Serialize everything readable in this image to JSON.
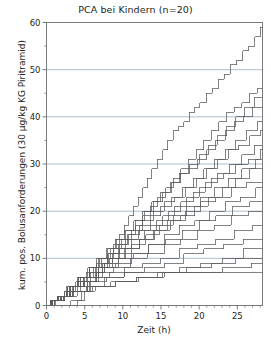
{
  "chart_data": {
    "type": "line",
    "title": "PCA bei Kindern (n=20)",
    "xlabel": "Zeit (h)",
    "ylabel": "kum. pos. Bolusanforderungen (30 µg/kg KG Piritramid)",
    "xlim": [
      0,
      28.3
    ],
    "ylim": [
      0,
      60
    ],
    "xticks": [
      0,
      5,
      10,
      15,
      20,
      25
    ],
    "xtick_labels": [
      "0",
      "5",
      "10",
      "15",
      "20",
      "25"
    ],
    "xminor_ticks": [
      1,
      2,
      3,
      4,
      6,
      7,
      8,
      9,
      11,
      12,
      13,
      14,
      16,
      17,
      18,
      19,
      21,
      22,
      23,
      24,
      26,
      27,
      28
    ],
    "yticks": [
      0,
      10,
      20,
      30,
      40,
      50,
      60
    ],
    "ytick_labels": [
      "0",
      "10",
      "20",
      "30",
      "40",
      "50",
      "60"
    ],
    "yminor_ticks": [
      5,
      15,
      25,
      35,
      45,
      55
    ],
    "grid": "horizontal-major",
    "gridlines_y": [
      10,
      20,
      30,
      40,
      50
    ],
    "grid_color": "#9fb8cc",
    "line_color": "#58595b",
    "axis_color": "#6d6e71",
    "legend": "none",
    "n_patients": 20,
    "interpolation": "step-after",
    "series": [
      {
        "name": "Patient 1",
        "x": [
          0,
          4.0,
          5.0,
          5.8,
          6.8,
          7.4,
          8.1,
          8.8,
          9.5,
          10.2,
          10.8,
          11.4,
          12.0,
          12.6,
          13.2,
          13.8,
          14.5,
          15.2,
          15.9,
          16.6,
          17.3,
          18.0,
          18.7,
          19.4,
          20.1,
          20.9,
          21.7,
          22.5,
          23.3,
          24.1,
          24.9,
          25.7,
          26.5,
          27.3,
          28.0,
          28.3
        ],
        "y": [
          0,
          1,
          3,
          5,
          7,
          9,
          11,
          13,
          15,
          17,
          19,
          21,
          23,
          25,
          27,
          29,
          31,
          33,
          35,
          37,
          38,
          39,
          41,
          42,
          43,
          45,
          46,
          48,
          49,
          51,
          52,
          54,
          55,
          57,
          59,
          59
        ]
      },
      {
        "name": "Patient 2",
        "x": [
          0,
          3.2,
          4.6,
          5.6,
          6.6,
          7.6,
          8.6,
          9.6,
          10.6,
          11.6,
          12.6,
          13.6,
          14.6,
          15.6,
          16.6,
          17.6,
          18.6,
          19.6,
          20.6,
          21.6,
          22.6,
          23.6,
          24.6,
          25.6,
          26.6,
          27.6,
          28.3
        ],
        "y": [
          0,
          1,
          3,
          5,
          7,
          9,
          11,
          13,
          15,
          17,
          19,
          21,
          23,
          25,
          27,
          29,
          31,
          33,
          35,
          37,
          39,
          41,
          42,
          43,
          45,
          46,
          46
        ]
      },
      {
        "name": "Patient 3",
        "x": [
          0,
          1.2,
          2.2,
          3.2,
          4.4,
          5.6,
          6.8,
          8.0,
          9.2,
          10.4,
          11.6,
          12.8,
          14.0,
          15.2,
          16.4,
          17.6,
          18.8,
          20.0,
          21.2,
          22.4,
          23.6,
          24.8,
          26.0,
          27.2,
          28.3
        ],
        "y": [
          0,
          1,
          2,
          4,
          6,
          8,
          10,
          12,
          14,
          16,
          18,
          20,
          22,
          24,
          26,
          28,
          30,
          32,
          34,
          36,
          38,
          40,
          42,
          44,
          44
        ]
      },
      {
        "name": "Patient 4",
        "x": [
          0,
          0.8,
          1.8,
          3.0,
          4.2,
          5.4,
          6.6,
          7.8,
          9.0,
          10.2,
          11.4,
          12.6,
          13.8,
          15.0,
          16.2,
          17.4,
          18.6,
          19.8,
          21.0,
          22.2,
          23.4,
          24.6,
          25.8,
          27.0,
          28.3
        ],
        "y": [
          0,
          1,
          2,
          4,
          6,
          8,
          10,
          12,
          14,
          16,
          18,
          20,
          22,
          24,
          26,
          28,
          29,
          31,
          33,
          35,
          37,
          39,
          40,
          42,
          42
        ]
      },
      {
        "name": "Patient 5",
        "x": [
          0,
          1.0,
          2.4,
          3.8,
          5.2,
          6.6,
          8.0,
          9.4,
          10.8,
          12.2,
          13.6,
          15.0,
          16.4,
          17.8,
          19.2,
          20.6,
          22.0,
          23.4,
          24.8,
          26.2,
          27.6,
          28.3
        ],
        "y": [
          0,
          1,
          3,
          5,
          7,
          9,
          11,
          13,
          15,
          17,
          19,
          21,
          23,
          25,
          27,
          29,
          31,
          33,
          35,
          37,
          39,
          39
        ]
      },
      {
        "name": "Patient 6",
        "x": [
          0,
          0.6,
          1.6,
          2.8,
          4.2,
          5.6,
          7.0,
          8.4,
          9.8,
          11.2,
          12.6,
          14.0,
          15.4,
          16.8,
          18.2,
          19.6,
          21.0,
          22.4,
          23.8,
          25.2,
          26.6,
          28.0,
          28.3
        ],
        "y": [
          0,
          1,
          2,
          4,
          6,
          8,
          10,
          12,
          14,
          16,
          18,
          20,
          22,
          23,
          25,
          27,
          29,
          31,
          33,
          34,
          36,
          37,
          37
        ]
      },
      {
        "name": "Patient 7",
        "x": [
          0,
          0.8,
          2.0,
          3.4,
          4.8,
          6.4,
          8.0,
          9.6,
          11.2,
          12.8,
          14.4,
          16.0,
          17.6,
          19.2,
          20.8,
          22.4,
          24.0,
          25.6,
          27.2,
          28.3
        ],
        "y": [
          0,
          1,
          2,
          4,
          6,
          8,
          10,
          12,
          14,
          16,
          18,
          20,
          22,
          24,
          26,
          28,
          30,
          32,
          34,
          34
        ]
      },
      {
        "name": "Patient 8",
        "x": [
          0,
          0.5,
          1.4,
          2.6,
          4.0,
          5.6,
          7.2,
          8.8,
          10.4,
          12.0,
          13.6,
          15.2,
          16.8,
          18.4,
          20.0,
          21.6,
          23.2,
          24.8,
          26.4,
          28.0,
          28.3
        ],
        "y": [
          0,
          1,
          2,
          4,
          6,
          8,
          10,
          12,
          14,
          16,
          17,
          19,
          21,
          23,
          25,
          27,
          28,
          30,
          31,
          33,
          33
        ]
      },
      {
        "name": "Patient 9",
        "x": [
          0,
          1.0,
          2.4,
          4.0,
          5.8,
          7.6,
          9.4,
          11.2,
          13.0,
          14.8,
          16.6,
          18.4,
          20.2,
          22.0,
          23.8,
          25.6,
          27.4,
          28.3
        ],
        "y": [
          0,
          1,
          3,
          5,
          7,
          9,
          11,
          13,
          15,
          17,
          19,
          21,
          23,
          25,
          27,
          29,
          31,
          31
        ]
      },
      {
        "name": "Patient 10",
        "x": [
          0,
          0.6,
          1.8,
          3.2,
          5.0,
          6.8,
          8.6,
          10.4,
          12.2,
          14.0,
          15.8,
          17.6,
          19.4,
          21.2,
          23.0,
          24.8,
          26.6,
          28.3
        ],
        "y": [
          0,
          1,
          2,
          4,
          6,
          8,
          10,
          12,
          14,
          16,
          18,
          19,
          21,
          23,
          25,
          27,
          29,
          29
        ]
      },
      {
        "name": "Patient 11",
        "x": [
          0,
          0.5,
          1.5,
          2.8,
          4.4,
          6.2,
          8.2,
          10.2,
          12.2,
          14.2,
          16.2,
          18.2,
          20.2,
          22.2,
          24.2,
          26.2,
          28.3
        ],
        "y": [
          0,
          1,
          2,
          4,
          6,
          8,
          10,
          12,
          14,
          16,
          18,
          20,
          22,
          23,
          25,
          26,
          26
        ]
      },
      {
        "name": "Patient 12",
        "x": [
          0,
          0.8,
          2.0,
          3.6,
          5.4,
          7.4,
          9.4,
          11.4,
          13.4,
          15.4,
          17.4,
          19.4,
          21.4,
          23.4,
          25.4,
          27.4,
          28.3
        ],
        "y": [
          0,
          1,
          2,
          4,
          6,
          8,
          10,
          11,
          13,
          15,
          17,
          18,
          20,
          22,
          23,
          25,
          25
        ]
      },
      {
        "name": "Patient 13",
        "x": [
          0,
          0.6,
          1.6,
          3.0,
          4.8,
          6.8,
          9.0,
          11.2,
          13.4,
          15.6,
          17.8,
          20.0,
          22.2,
          24.4,
          26.6,
          28.3
        ],
        "y": [
          0,
          1,
          2,
          4,
          6,
          8,
          9,
          11,
          13,
          14,
          16,
          18,
          19,
          21,
          22,
          22
        ]
      },
      {
        "name": "Patient 14",
        "x": [
          0,
          0.5,
          1.4,
          2.6,
          4.4,
          6.6,
          8.8,
          11.0,
          13.2,
          15.4,
          17.6,
          19.8,
          22.0,
          24.2,
          26.4,
          28.3
        ],
        "y": [
          0,
          1,
          2,
          3,
          5,
          7,
          8,
          10,
          11,
          13,
          14,
          16,
          17,
          19,
          20,
          20
        ]
      },
      {
        "name": "Patient 15",
        "x": [
          0,
          0.6,
          1.8,
          3.4,
          5.4,
          7.8,
          10.2,
          12.6,
          15.0,
          17.4,
          19.8,
          22.2,
          24.6,
          27.0,
          28.3
        ],
        "y": [
          0,
          1,
          2,
          3,
          5,
          6,
          8,
          9,
          10,
          12,
          13,
          14,
          16,
          17,
          17
        ]
      },
      {
        "name": "Patient 16",
        "x": [
          0,
          0.5,
          1.6,
          3.2,
          5.2,
          7.6,
          10.2,
          12.8,
          15.4,
          18.0,
          20.6,
          23.2,
          25.8,
          28.3
        ],
        "y": [
          0,
          1,
          2,
          3,
          4,
          6,
          7,
          8,
          9,
          11,
          12,
          13,
          14,
          14
        ]
      },
      {
        "name": "Patient 17",
        "x": [
          0,
          0.8,
          2.2,
          4.0,
          6.4,
          9.0,
          11.8,
          14.6,
          17.4,
          20.2,
          23.0,
          25.8,
          28.3
        ],
        "y": [
          0,
          1,
          2,
          3,
          4,
          5,
          6,
          7,
          8,
          9,
          10,
          12,
          12
        ]
      },
      {
        "name": "Patient 18",
        "x": [
          0,
          0.6,
          1.8,
          3.6,
          6.0,
          9.0,
          12.0,
          15.2,
          18.4,
          21.6,
          24.8,
          28.3
        ],
        "y": [
          0,
          1,
          2,
          3,
          4,
          5,
          6,
          7,
          8,
          9,
          10,
          10
        ]
      },
      {
        "name": "Patient 19",
        "x": [
          0,
          0.5,
          1.5,
          3.0,
          5.4,
          8.4,
          11.8,
          15.4,
          19.2,
          23.0,
          26.8,
          28.3
        ],
        "y": [
          0,
          1,
          2,
          3,
          4,
          5,
          6,
          7,
          7,
          8,
          9,
          9
        ]
      },
      {
        "name": "Patient 20",
        "x": [
          0,
          0.6,
          1.6,
          2.6,
          3.6,
          5.0,
          6.4,
          8.2,
          28.3
        ],
        "y": [
          0,
          1,
          2,
          3,
          4,
          5,
          6,
          7,
          7
        ]
      }
    ]
  },
  "figure": {
    "title": "PCA bei Kindern (n=20)",
    "xlabel": "Zeit (h)",
    "ylabel": "kum. pos. Bolusanforderungen (30 µg/kg KG Piritramid)"
  }
}
